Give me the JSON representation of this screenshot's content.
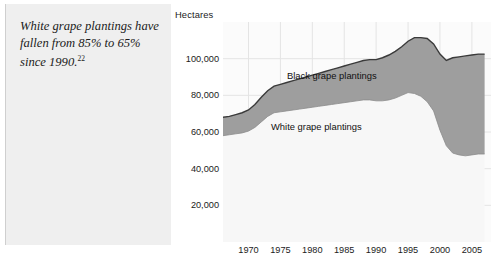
{
  "caption": {
    "text": "White grape plantings have fallen from 85% to 65% since 1990.",
    "footnote_marker": "22"
  },
  "chart_data": {
    "type": "area",
    "stacked": true,
    "title": "",
    "subtitle": "",
    "xlabel": "",
    "ylabel": "Hectares",
    "ylim": [
      0,
      120000
    ],
    "xlim": [
      1966,
      2008
    ],
    "grid": true,
    "legend_position": "inline-annotations",
    "ytick_labels": [
      "20,000",
      "40,000",
      "60,000",
      "80,000",
      "100,000"
    ],
    "ytick_values": [
      20000,
      40000,
      60000,
      80000,
      100000
    ],
    "xtick_labels": [
      "1970",
      "1975",
      "1980",
      "1985",
      "1990",
      "1995",
      "2000",
      "2005"
    ],
    "xtick_values": [
      1970,
      1975,
      1980,
      1985,
      1990,
      1995,
      2000,
      2005
    ],
    "x": [
      1966,
      1967,
      1968,
      1969,
      1970,
      1971,
      1972,
      1973,
      1974,
      1975,
      1976,
      1977,
      1978,
      1979,
      1980,
      1981,
      1982,
      1983,
      1984,
      1985,
      1986,
      1987,
      1988,
      1989,
      1990,
      1991,
      1992,
      1993,
      1994,
      1995,
      1996,
      1997,
      1998,
      1999,
      2000,
      2001,
      2002,
      2003,
      2004,
      2005,
      2006,
      2007
    ],
    "series": [
      {
        "name": "White grape plantings",
        "color": "#f7f7f7",
        "values": [
          58000,
          58500,
          59000,
          59500,
          60500,
          62500,
          65500,
          68500,
          70500,
          71000,
          71500,
          72000,
          72500,
          73000,
          73500,
          74000,
          74500,
          75000,
          75500,
          76000,
          76500,
          77000,
          77500,
          77500,
          77000,
          77000,
          77500,
          78500,
          80000,
          81500,
          81000,
          79500,
          76500,
          71500,
          61000,
          52500,
          48500,
          47500,
          47000,
          47500,
          48000,
          48000
        ]
      },
      {
        "name": "Black grape plantings",
        "color": "#9e9e9e",
        "values": [
          10000,
          10000,
          10500,
          11000,
          11500,
          12500,
          13500,
          14000,
          14500,
          15000,
          15500,
          16000,
          16500,
          17000,
          17500,
          18000,
          18500,
          19000,
          19500,
          20000,
          20500,
          21000,
          21500,
          22000,
          22500,
          23500,
          24500,
          25500,
          26500,
          28000,
          30500,
          32000,
          34500,
          36500,
          41500,
          46500,
          52000,
          53500,
          54500,
          54500,
          54500,
          54500
        ]
      }
    ],
    "totals": [
      68000,
      68500,
      69500,
      70500,
      72000,
      75000,
      79000,
      82500,
      85000,
      86000,
      87000,
      88000,
      89000,
      90000,
      91000,
      92000,
      93000,
      94000,
      95000,
      96000,
      97000,
      98000,
      99000,
      99500,
      99500,
      100500,
      102000,
      104000,
      106500,
      109500,
      111500,
      111500,
      111000,
      108000,
      102500,
      99000,
      100500,
      101000,
      101500,
      102000,
      102500,
      102500
    ],
    "annotations": [
      {
        "name": "black-grape-label",
        "text": "Black grape plantings"
      },
      {
        "name": "white-grape-label",
        "text": "White grape plantings"
      }
    ],
    "colors": {
      "black_grape_fill": "#9e9e9e",
      "white_grape_fill": "#f7f7f7",
      "outline": "#3a3a3a",
      "grid": "#e4e4e4",
      "plot_background": "#fbfbfb",
      "caption_panel": "#efefef"
    }
  }
}
